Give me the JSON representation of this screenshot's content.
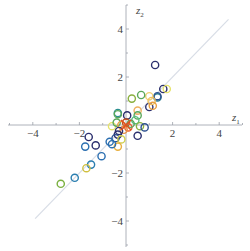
{
  "chart_data": {
    "type": "scatter",
    "title": "",
    "xlabel": "z1",
    "ylabel": "z2",
    "xlim": [
      -5.2,
      5.2
    ],
    "ylim": [
      -5.2,
      5.2
    ],
    "grid": false,
    "legend": null,
    "x_ticks": [
      -4,
      -2,
      2,
      4
    ],
    "y_ticks": [
      4,
      2,
      -2,
      -4
    ],
    "reference_line": {
      "slope": 1,
      "intercept": 0,
      "x_range": [
        -3.9,
        4.4
      ],
      "color": "#d8dde6"
    },
    "marker": "open-circle",
    "points": [
      {
        "x": 1.25,
        "y": 2.5,
        "color": "#2b2f6e"
      },
      {
        "x": 1.6,
        "y": 1.5,
        "color": "#2b2f6e"
      },
      {
        "x": 1.75,
        "y": 1.5,
        "color": "#e6e36a"
      },
      {
        "x": 1.35,
        "y": 1.15,
        "color": "#2a7e8e"
      },
      {
        "x": 1.35,
        "y": 1.2,
        "color": "#2b4f8e"
      },
      {
        "x": 1.0,
        "y": 0.75,
        "color": "#2b2f6e"
      },
      {
        "x": 1.0,
        "y": 1.2,
        "color": "#f0d070"
      },
      {
        "x": 1.1,
        "y": 1.0,
        "color": "#f0c060"
      },
      {
        "x": 1.15,
        "y": 0.8,
        "color": "#e8a040"
      },
      {
        "x": 0.65,
        "y": 1.25,
        "color": "#5aa85a"
      },
      {
        "x": 0.25,
        "y": 1.1,
        "color": "#8ab040"
      },
      {
        "x": 0.5,
        "y": 0.6,
        "color": "#f0b060"
      },
      {
        "x": 0.05,
        "y": 0.4,
        "color": "#2b2f6e"
      },
      {
        "x": -0.35,
        "y": 0.5,
        "color": "#2a8e8e"
      },
      {
        "x": -0.35,
        "y": 0.45,
        "color": "#5aa85a"
      },
      {
        "x": 0.5,
        "y": 0.4,
        "color": "#5aa85a"
      },
      {
        "x": 0.4,
        "y": 0.2,
        "color": "#5ac080"
      },
      {
        "x": 0.6,
        "y": -0.05,
        "color": "#8ab040"
      },
      {
        "x": 0.8,
        "y": -0.1,
        "color": "#2b4f8e"
      },
      {
        "x": 0.5,
        "y": -0.45,
        "color": "#2b2f6e"
      },
      {
        "x": -0.6,
        "y": -0.05,
        "color": "#e6e36a"
      },
      {
        "x": -0.4,
        "y": 0.1,
        "color": "#5aa85a"
      },
      {
        "x": -0.2,
        "y": 0.0,
        "color": "#e8a040"
      },
      {
        "x": 0.0,
        "y": 0.1,
        "color": "#c05020"
      },
      {
        "x": 0.1,
        "y": -0.1,
        "color": "#e86030"
      },
      {
        "x": -0.1,
        "y": -0.2,
        "color": "#e89040"
      },
      {
        "x": 0.2,
        "y": 0.05,
        "color": "#5aa85a"
      },
      {
        "x": -0.3,
        "y": -0.25,
        "color": "#2b2f6e"
      },
      {
        "x": -0.35,
        "y": -0.4,
        "color": "#2b2f6e"
      },
      {
        "x": -0.45,
        "y": -0.55,
        "color": "#2b4f8e"
      },
      {
        "x": -0.2,
        "y": -0.6,
        "color": "#d0d050"
      },
      {
        "x": -0.35,
        "y": -0.9,
        "color": "#e8b040"
      },
      {
        "x": -0.7,
        "y": -0.7,
        "color": "#2a6eb0"
      },
      {
        "x": -0.6,
        "y": -0.8,
        "color": "#2a6eb0"
      },
      {
        "x": -1.6,
        "y": -0.5,
        "color": "#2b2f6e"
      },
      {
        "x": -1.3,
        "y": -0.85,
        "color": "#2b2f6e"
      },
      {
        "x": -1.75,
        "y": -0.9,
        "color": "#2a6eb0"
      },
      {
        "x": -1.05,
        "y": -1.3,
        "color": "#2a6eb0"
      },
      {
        "x": -1.5,
        "y": -1.65,
        "color": "#2a7eb0"
      },
      {
        "x": -1.7,
        "y": -1.8,
        "color": "#d0c040"
      },
      {
        "x": -2.2,
        "y": -2.2,
        "color": "#2a7eb0"
      },
      {
        "x": -2.8,
        "y": -2.45,
        "color": "#7ab040"
      }
    ],
    "center_marker": {
      "x": 0.0,
      "y": 0.0,
      "shape": "x",
      "color": "#e05020"
    }
  }
}
